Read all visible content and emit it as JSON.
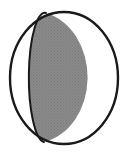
{
  "figure": {
    "name": "moon-phase-diagram",
    "canvas": {
      "width": 127,
      "height": 162
    },
    "background_color": "#ffffff"
  },
  "colors": {
    "background": "#ffffff",
    "outline": "#1a1a1a",
    "shaded_fill": "#878787",
    "unshaded_fill": "#ffffff",
    "terminator_line": "#1a1a1a"
  },
  "geometry": {
    "disc": {
      "center_x": 64,
      "center_y": 78,
      "radius_x": 55,
      "radius_y": 67,
      "left_edge_x": 9,
      "right_edge_x": 119,
      "top_edge_y": 11,
      "bottom_edge_y": 145,
      "stroke_width": 2.4
    },
    "terminator": {
      "top_point_x": 46,
      "top_point_y": 14,
      "bottom_point_x": 44,
      "bottom_point_y": 141,
      "leftmost_x": 31,
      "leftmost_y": 78,
      "curve_radius_x": 16,
      "curve_radius_y": 64,
      "stroke_width": 2.0
    }
  },
  "shading": {
    "shaded_side": "right",
    "unshaded_side": "left",
    "illuminated_fraction_label": "",
    "halftone_texture": true
  },
  "labels": {
    "caption": "",
    "annotation": ""
  }
}
